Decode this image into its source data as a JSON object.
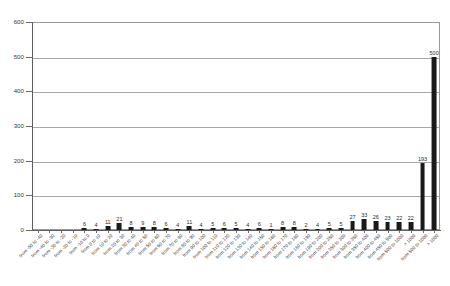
{
  "chart_data": {
    "type": "bar",
    "title": "",
    "subtitle": "",
    "xlabel": "",
    "ylabel": "",
    "ylim": [
      0,
      600
    ],
    "ytick_values": [
      0,
      100,
      200,
      300,
      400,
      500,
      600
    ],
    "ytick_labels": [
      "0",
      "100",
      "200",
      "300",
      "400",
      "500",
      "600"
    ],
    "grid": "horizontal",
    "legend": "none",
    "bar_color": "#1a1a1a",
    "show_value_labels": true,
    "categories": [
      "from -50 to -40",
      "from -40 to -30",
      "from -30 to -20",
      "from -20 to -10",
      "from -10 to 0",
      "from 0 to 10",
      "from 10 to 20",
      "from 20 to 30",
      "from 30 to 40",
      "from 40 to 50",
      "from 50 to 60",
      "from 60 to 70",
      "from 70 to 80",
      "from 80 to 90",
      "from 90 to 100",
      "from 100 to 110",
      "from 110 to 120",
      "from 120 to 130",
      "from 130 to 140",
      "from 140 to 150",
      "from 150 to 160",
      "from 160 to 170",
      "from 170 to 180",
      "from 180 to 190",
      "from 190 to 200",
      "from 200 to 250",
      "from 250 to 300",
      "from 300 to 350",
      "from 350 to 400",
      "from 400 to 450",
      "from 450 to 500",
      "from 500 to 1000",
      "> 1000"
    ],
    "values": [
      0,
      0,
      0,
      0,
      6,
      4,
      11,
      21,
      8,
      9,
      8,
      6,
      4,
      11,
      4,
      5,
      6,
      5,
      4,
      6,
      1,
      8,
      8,
      2,
      4,
      5,
      5,
      27,
      33,
      26,
      23,
      22,
      22
    ],
    "value_labels": [
      "",
      "",
      "",
      "",
      "6",
      "4",
      "11",
      "21",
      "8",
      "9",
      "8",
      "6",
      "4",
      "11",
      "4",
      "5",
      "6",
      "5",
      "4",
      "6",
      "1",
      "8",
      "8",
      "2",
      "4",
      "5",
      "5",
      "27",
      "33",
      "26",
      "23",
      "22",
      "22"
    ],
    "tall_bars": {
      "note": "two rightmost bars exceed the common bin heights",
      "labels": [
        "193",
        "500"
      ],
      "values": [
        193,
        500
      ]
    },
    "full_values": [
      0,
      0,
      0,
      0,
      6,
      4,
      11,
      21,
      8,
      9,
      8,
      6,
      4,
      11,
      4,
      5,
      6,
      5,
      4,
      6,
      1,
      8,
      8,
      2,
      4,
      5,
      5,
      27,
      33,
      26,
      23,
      22,
      22,
      193,
      500
    ],
    "full_value_labels": [
      "",
      "",
      "",
      "",
      "6",
      "4",
      "11",
      "21",
      "8",
      "9",
      "8",
      "6",
      "4",
      "11",
      "4",
      "5",
      "6",
      "5",
      "4",
      "6",
      "1",
      "8",
      "8",
      "2",
      "4",
      "5",
      "5",
      "27",
      "33",
      "26",
      "23",
      "22",
      "22",
      "193",
      "500"
    ],
    "full_categories": [
      "from -50 to -40",
      "from -40 to -30",
      "from -30 to -20",
      "from -20 to -10",
      "from -10 to 0",
      "from 0 to 10",
      "from 10 to 20",
      "from 20 to 30",
      "from 30 to 40",
      "from 40 to 50",
      "from 50 to 60",
      "from 60 to 70",
      "from 70 to 80",
      "from 80 to 90",
      "from 90 to 100",
      "from 100 to 110",
      "from 110 to 120",
      "from 120 to 130",
      "from 130 to 140",
      "from 140 to 150",
      "from 150 to 160",
      "from 160 to 170",
      "from 170 to 180",
      "from 180 to 190",
      "from 190 to 200",
      "from 200 to 250",
      "from 250 to 300",
      "from 300 to 350",
      "from 350 to 400",
      "from 400 to 450",
      "from 450 to 500",
      "from 500 to 1000",
      "> 1000",
      "from 500 to 1000",
      "> 1000"
    ]
  }
}
